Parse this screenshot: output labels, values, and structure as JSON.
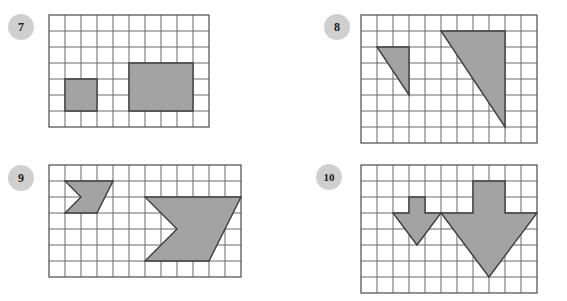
{
  "page": {
    "background_color": "#ffffff"
  },
  "style": {
    "grid_line_color": "#5a5a5a",
    "grid_line_thin_color": "#8c8c8c",
    "grid_border_color": "#4a4a4a",
    "shape_fill": "#a3a3a3",
    "shape_stroke": "#3c3c3c",
    "badge_fill": "#cfcfcf",
    "badge_text_color": "#1a1a1a",
    "cell_size": 16
  },
  "problems": [
    {
      "id": "problem-7",
      "number": "7",
      "badge_x": 8,
      "badge_y": 14,
      "grid": {
        "x": 48,
        "y": 14,
        "cols": 10,
        "rows": 7,
        "cell": 16
      },
      "shape_type": "rectangle-pair",
      "figures": [
        {
          "name": "small-rectangle",
          "cells_wide": 2,
          "cells_tall": 2,
          "points": "1,4 3,4 3,6 1,6"
        },
        {
          "name": "large-rectangle",
          "cells_wide": 4,
          "cells_tall": 3,
          "points": "5,3 9,3 9,6 5,6"
        }
      ]
    },
    {
      "id": "problem-8",
      "number": "8",
      "badge_x": 324,
      "badge_y": 14,
      "grid": {
        "x": 360,
        "y": 14,
        "cols": 11,
        "rows": 8,
        "cell": 16
      },
      "shape_type": "right-triangle-pair",
      "figures": [
        {
          "name": "small-triangle",
          "cells_wide": 2,
          "cells_tall": 3,
          "points": "1,2 3,2 3,5"
        },
        {
          "name": "large-triangle",
          "cells_wide": 4,
          "cells_tall": 6,
          "points": "5,1 9,1 9,7"
        }
      ]
    },
    {
      "id": "problem-9",
      "number": "9",
      "badge_x": 8,
      "badge_y": 165,
      "grid": {
        "x": 48,
        "y": 164,
        "cols": 12,
        "rows": 7,
        "cell": 16
      },
      "shape_type": "chevron-pair",
      "figures": [
        {
          "name": "small-chevron",
          "cells_wide": 3,
          "cells_tall": 2,
          "points": "1,1 4,1 3,3 1,3 2,2"
        },
        {
          "name": "large-chevron",
          "cells_wide": 6,
          "cells_tall": 4,
          "points": "6,2 12,2 10,6 6,6 8,4"
        }
      ]
    },
    {
      "id": "problem-10",
      "number": "10",
      "badge_x": 316,
      "badge_y": 164,
      "grid": {
        "x": 360,
        "y": 164,
        "cols": 11,
        "rows": 8,
        "cell": 16
      },
      "shape_type": "down-arrow-pair",
      "figures": [
        {
          "name": "small-arrow",
          "cells_wide": 3,
          "cells_tall": 3,
          "points": "3,2 4,2 4,3 5,3 3.5,5 2,3 3,3"
        },
        {
          "name": "large-arrow",
          "cells_wide": 6,
          "cells_tall": 6,
          "points": "7,1 9,1 9,3 11,3 8,7 5,3 7,3"
        }
      ]
    }
  ]
}
